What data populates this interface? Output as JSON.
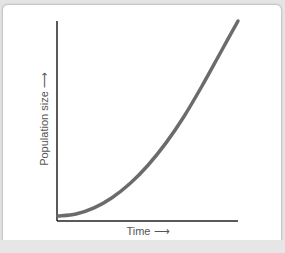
{
  "chart_data": {
    "type": "line",
    "title": "",
    "xlabel": "Time",
    "ylabel": "Population size",
    "x_arrow": "⟶",
    "y_arrow": "⟶",
    "grid": false,
    "legend": null,
    "ticks": {
      "x": [],
      "y": []
    },
    "series": [
      {
        "name": "Population",
        "color": "#6b6b6b",
        "x": [
          0,
          0.1,
          0.2,
          0.3,
          0.4,
          0.5,
          0.6,
          0.7,
          0.8,
          0.9,
          1.0
        ],
        "y": [
          0.04,
          0.05,
          0.08,
          0.13,
          0.2,
          0.29,
          0.4,
          0.53,
          0.68,
          0.84,
          1.0
        ]
      }
    ]
  },
  "labels": {
    "y_axis": "Population size ⟶",
    "x_axis": "Time ⟶"
  },
  "colors": {
    "curve": "#6b6b6b",
    "axis": "#222222",
    "background": "#ffffff",
    "frame": "#c8c8c8"
  }
}
